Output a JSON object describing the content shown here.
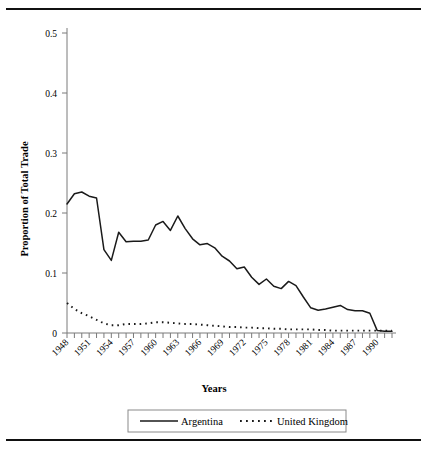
{
  "figure": {
    "top_rule": true,
    "bottom_rule": true
  },
  "chart_data": {
    "type": "line",
    "title": "",
    "xlabel": "Years",
    "ylabel": "Proportion of Total Trade",
    "ylim": [
      0,
      0.5
    ],
    "ytick_labels": [
      "0",
      "0.1",
      "0.2",
      "0.3",
      "0.4",
      "0.5"
    ],
    "ytick_values": [
      0,
      0.1,
      0.2,
      0.3,
      0.4,
      0.5
    ],
    "xlim": [
      1948,
      1992
    ],
    "xtick_labels": [
      "1948",
      "1951",
      "1954",
      "1957",
      "1960",
      "1963",
      "1966",
      "1969",
      "1972",
      "1975",
      "1978",
      "1981",
      "1984",
      "1987",
      "1990"
    ],
    "xtick_values": [
      1948,
      1951,
      1954,
      1957,
      1960,
      1963,
      1966,
      1969,
      1972,
      1975,
      1978,
      1981,
      1984,
      1987,
      1990
    ],
    "grid": false,
    "legend_position": "bottom",
    "x": [
      1948,
      1949,
      1950,
      1951,
      1952,
      1953,
      1954,
      1955,
      1956,
      1957,
      1958,
      1959,
      1960,
      1961,
      1962,
      1963,
      1964,
      1965,
      1966,
      1967,
      1968,
      1969,
      1970,
      1971,
      1972,
      1973,
      1974,
      1975,
      1976,
      1977,
      1978,
      1979,
      1980,
      1981,
      1982,
      1983,
      1984,
      1985,
      1986,
      1987,
      1988,
      1989,
      1990,
      1991,
      1992
    ],
    "series": [
      {
        "name": "Argentina",
        "style": "solid",
        "color": "#1a1a1a",
        "values": [
          0.215,
          0.232,
          0.235,
          0.228,
          0.225,
          0.139,
          0.121,
          0.168,
          0.152,
          0.153,
          0.153,
          0.155,
          0.18,
          0.186,
          0.171,
          0.195,
          0.174,
          0.157,
          0.147,
          0.149,
          0.142,
          0.128,
          0.12,
          0.107,
          0.11,
          0.093,
          0.081,
          0.09,
          0.078,
          0.074,
          0.086,
          0.079,
          0.06,
          0.042,
          0.038,
          0.04,
          0.043,
          0.046,
          0.039,
          0.037,
          0.037,
          0.033,
          0.004,
          0.003,
          0.003
        ]
      },
      {
        "name": "United Kingdom",
        "style": "dotted",
        "color": "#1a1a1a",
        "values": [
          0.05,
          0.04,
          0.033,
          0.028,
          0.022,
          0.016,
          0.013,
          0.013,
          0.015,
          0.015,
          0.015,
          0.016,
          0.018,
          0.018,
          0.017,
          0.016,
          0.015,
          0.015,
          0.014,
          0.013,
          0.012,
          0.011,
          0.01,
          0.01,
          0.009,
          0.009,
          0.008,
          0.008,
          0.007,
          0.007,
          0.006,
          0.006,
          0.006,
          0.006,
          0.005,
          0.005,
          0.004,
          0.004,
          0.004,
          0.004,
          0.004,
          0.004,
          0.004,
          0.004,
          0.004
        ]
      }
    ],
    "argentina_late": [
      0.004,
      0.004,
      0.005,
      0.011,
      0.013,
      0.014,
      0.016,
      0.016,
      0.016
    ],
    "annotations": []
  },
  "legend": {
    "entries": [
      {
        "label": "Argentina",
        "style": "solid"
      },
      {
        "label": "United Kingdom",
        "style": "dotted"
      }
    ]
  }
}
